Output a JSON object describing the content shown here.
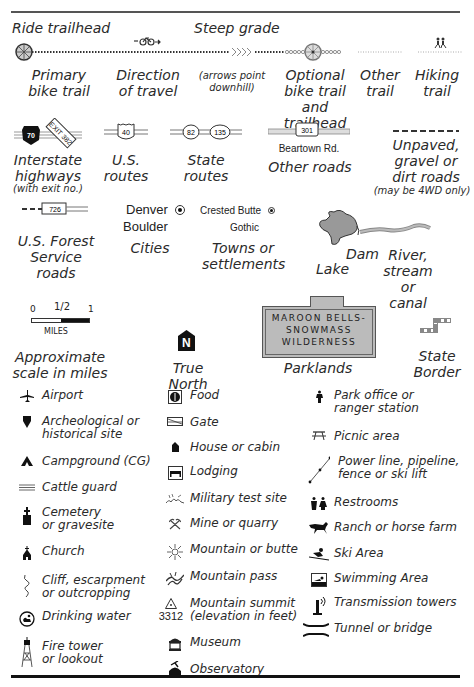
{
  "trails": {
    "ride_trailhead": "Ride trailhead",
    "steep_grade": "Steep grade",
    "primary_bike_trail": [
      "Primary",
      "bike trail"
    ],
    "direction_of_travel": [
      "Direction",
      "of travel"
    ],
    "arrows_note": [
      "(arrows point",
      "downhill)"
    ],
    "optional_bike_trail": [
      "Optional",
      "bike trail",
      "and trailhead"
    ],
    "other_trail": [
      "Other",
      "trail"
    ],
    "hiking_trail": [
      "Hiking",
      "trail"
    ]
  },
  "roads": {
    "interstate": {
      "shield": "70",
      "exit": "EXIT 382",
      "label": [
        "Interstate",
        "highways"
      ],
      "note": "(with exit no.)"
    },
    "us_routes": {
      "shield": "40",
      "label": [
        "U.S.",
        "routes"
      ]
    },
    "state_routes": {
      "shields": [
        "82",
        "135"
      ],
      "label": [
        "State",
        "routes"
      ]
    },
    "other_roads": {
      "shield": "301",
      "road_name": "Beartown Rd.",
      "label": "Other roads"
    },
    "unpaved": {
      "label": [
        "Unpaved,",
        "gravel or",
        "dirt roads"
      ],
      "note": "(may be 4WD only)"
    },
    "forest_service": {
      "shield": "726",
      "label": [
        "U.S. Forest",
        "Service roads"
      ]
    }
  },
  "places": {
    "cities": {
      "examples": [
        "Denver",
        "Boulder"
      ],
      "label": "Cities"
    },
    "towns": {
      "examples": [
        "Crested Butte",
        "Gothic"
      ],
      "label": [
        "Towns or",
        "settlements"
      ]
    },
    "water": {
      "dam": "Dam",
      "lake": "Lake",
      "river": [
        "River,",
        "stream",
        "or canal"
      ]
    }
  },
  "scale": {
    "ticks": [
      "0",
      "1/2",
      "1"
    ],
    "unit": "MILES",
    "label": [
      "Approximate",
      "scale in miles"
    ]
  },
  "north": {
    "glyph": "N",
    "label": "True North"
  },
  "parklands": {
    "sign": [
      "MAROON BELLS-",
      "SNOWMASS",
      "WILDERNESS"
    ],
    "label": "Parklands"
  },
  "state_border": {
    "label": [
      "State",
      "Border"
    ]
  },
  "symbols": {
    "col1": [
      {
        "icon": "airplane-icon",
        "label": [
          "Airport"
        ]
      },
      {
        "icon": "archeological-site-icon",
        "label": [
          "Archeological or",
          "historical site"
        ]
      },
      {
        "icon": "campground-icon",
        "label": [
          "Campground (CG)"
        ]
      },
      {
        "icon": "cattle-guard-icon",
        "label": [
          "Cattle guard"
        ]
      },
      {
        "icon": "cemetery-icon",
        "label": [
          "Cemetery",
          "or gravesite"
        ]
      },
      {
        "icon": "church-icon",
        "label": [
          "Church"
        ]
      },
      {
        "icon": "cliff-icon",
        "label": [
          "Cliff, escarpment",
          "or outcropping"
        ]
      },
      {
        "icon": "drinking-water-icon",
        "label": [
          "Drinking water"
        ]
      },
      {
        "icon": "fire-tower-icon",
        "label": [
          "Fire tower",
          "or lookout"
        ]
      }
    ],
    "col2": [
      {
        "icon": "food-icon",
        "label": [
          "Food"
        ]
      },
      {
        "icon": "gate-icon",
        "label": [
          "Gate"
        ]
      },
      {
        "icon": "house-icon",
        "label": [
          "House or cabin"
        ]
      },
      {
        "icon": "lodging-icon",
        "label": [
          "Lodging"
        ]
      },
      {
        "icon": "military-site-icon",
        "label": [
          "Military test site"
        ]
      },
      {
        "icon": "mine-icon",
        "label": [
          "Mine or quarry"
        ]
      },
      {
        "icon": "mountain-icon",
        "label": [
          "Mountain or butte"
        ]
      },
      {
        "icon": "mountain-pass-icon",
        "label": [
          "Mountain pass"
        ]
      },
      {
        "icon": "summit-icon",
        "elevation": "3312",
        "label": [
          "Mountain summit",
          "(elevation in feet)"
        ]
      },
      {
        "icon": "museum-icon",
        "label": [
          "Museum"
        ]
      },
      {
        "icon": "observatory-icon",
        "label": [
          "Observatory"
        ]
      }
    ],
    "col3": [
      {
        "icon": "park-office-icon",
        "label": [
          "Park office or",
          "ranger station"
        ]
      },
      {
        "icon": "picnic-icon",
        "label": [
          "Picnic area"
        ]
      },
      {
        "icon": "power-line-icon",
        "label": [
          "Power line, pipeline,",
          "fence or ski lift"
        ]
      },
      {
        "icon": "restrooms-icon",
        "label": [
          "Restrooms"
        ]
      },
      {
        "icon": "ranch-icon",
        "label": [
          "Ranch or horse farm"
        ]
      },
      {
        "icon": "ski-icon",
        "label": [
          "Ski Area"
        ]
      },
      {
        "icon": "swimming-icon",
        "label": [
          "Swimming Area"
        ]
      },
      {
        "icon": "transmission-tower-icon",
        "label": [
          "Transmission towers"
        ]
      },
      {
        "icon": "tunnel-bridge-icon",
        "label": [
          "Tunnel or bridge"
        ]
      }
    ]
  }
}
